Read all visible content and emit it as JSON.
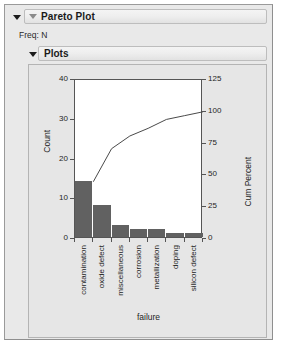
{
  "window": {
    "title": "Pareto Plot",
    "freq_label": "Freq: N",
    "section_title": "Plots",
    "outer_disclosure_icon": "triangle-down-icon",
    "title_disclosure_icon": "triangle-down-icon",
    "section_disclosure_icon": "triangle-down-icon"
  },
  "colors": {
    "bar_fill": "#616161",
    "line": "#4a4a4a",
    "panel_bg": "#e6e6e6",
    "plot_bg": "#ffffff",
    "axis": "#555555",
    "window_bg": "#e9e9e9"
  },
  "chart_data": {
    "type": "bar",
    "title": "Pareto Plot",
    "categories": [
      "contamination",
      "oxide defect",
      "miscellaneous",
      "corrosion",
      "metallization",
      "doping",
      "silicon defect"
    ],
    "values": [
      14,
      8,
      3,
      2,
      2,
      1,
      1
    ],
    "cum_percent": [
      45,
      71,
      81,
      87,
      94,
      97,
      100
    ],
    "total": 31,
    "xlabel": "failure",
    "ylabel": "Count",
    "y2label": "Cum Percent",
    "ylim": [
      0,
      40
    ],
    "yticks": [
      0,
      10,
      20,
      30,
      40
    ],
    "y2lim": [
      0,
      125
    ],
    "y2ticks": [
      0,
      25,
      50,
      75,
      100,
      125
    ],
    "grid": false,
    "legend": "none",
    "series": [
      {
        "name": "Count",
        "type": "bar",
        "values": [
          14,
          8,
          3,
          2,
          2,
          1,
          1
        ]
      },
      {
        "name": "Cum Percent",
        "type": "line",
        "values": [
          45,
          71,
          81,
          87,
          94,
          97,
          100
        ]
      }
    ]
  }
}
